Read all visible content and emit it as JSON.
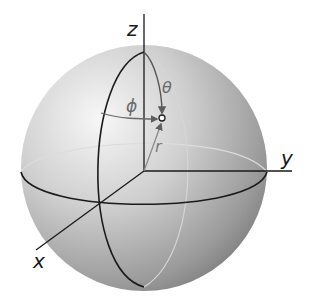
{
  "figure": {
    "labels": {
      "z_axis": "z",
      "y_axis": "y",
      "x_axis": "x",
      "theta": "θ",
      "phi": "ϕ",
      "r": "r"
    },
    "colors": {
      "axis": "#1a1a1a",
      "annotation": "#6a6a6a",
      "sphere_light": "#f4f4f4",
      "sphere_dark": "#7c7c7c",
      "back_curve": "#d8d8d8"
    }
  }
}
